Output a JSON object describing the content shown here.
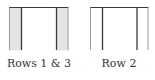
{
  "figure": {
    "panels": [
      {
        "id": "rows-1-3",
        "label": "Rows 1 & 3",
        "shaded_outer_bays": true
      },
      {
        "id": "row-2",
        "label": "Row 2",
        "shaded_outer_bays": false
      }
    ]
  },
  "colors": {
    "dark_line": "#3a3a3a",
    "light_line": "#9a9a9a",
    "shade_fill": "#e4e4e4",
    "label_text": "#333333",
    "background": "#ffffff"
  }
}
